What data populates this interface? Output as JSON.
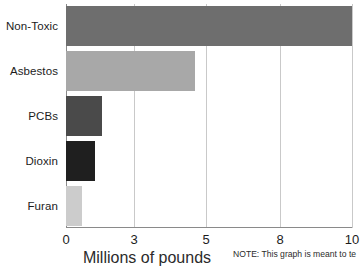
{
  "chart_data": {
    "type": "bar",
    "orientation": "horizontal",
    "title": "",
    "xlabel": "Millions of pounds",
    "ylabel": "",
    "categories": [
      "Non-Toxic",
      "Asbestos",
      "PCBs",
      "Dioxin",
      "Furan"
    ],
    "values": [
      10,
      4.7,
      1.6,
      1.3,
      0.7
    ],
    "xticks": [
      0,
      3,
      5,
      8,
      10
    ],
    "xtick_labels": [
      "0",
      "3",
      "5",
      "8",
      "10"
    ],
    "xlim": [
      0,
      10
    ],
    "grid": true,
    "grid_axis": "x",
    "legend": "none",
    "bar_colors": [
      "#6e6e6e",
      "#a8a8a8",
      "#4a4a4a",
      "#1f1f1f",
      "#cccccc"
    ],
    "series": [
      {
        "name": "Millions of pounds",
        "points": [
          {
            "category": "Non-Toxic",
            "value": 10,
            "color": "#6e6e6e"
          },
          {
            "category": "Asbestos",
            "value": 4.7,
            "color": "#a8a8a8"
          },
          {
            "category": "PCBs",
            "value": 1.6,
            "color": "#4a4a4a"
          },
          {
            "category": "Dioxin",
            "value": 1.3,
            "color": "#1f1f1f"
          },
          {
            "category": "Furan",
            "value": 0.7,
            "color": "#cccccc"
          }
        ]
      }
    ],
    "annotations": [
      "NOTE: This graph is meant to te",
      ""
    ]
  },
  "note": {
    "line1": "NOTE: This graph is meant to te",
    "line2": ""
  },
  "colors": {
    "gridline": "#c9c9c9",
    "axis": "#8a8a8a",
    "text": "#1c1c1c",
    "background": "#ffffff"
  }
}
